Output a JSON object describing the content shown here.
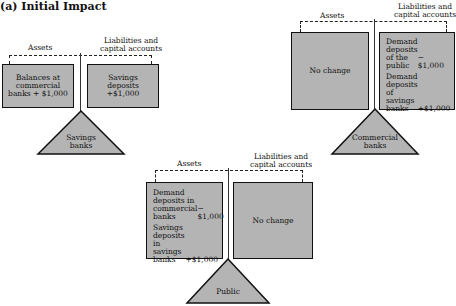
{
  "title": "(a) Initial Impact",
  "colors": {
    "box_fill": "#b4b4b4",
    "stroke": "#111111"
  },
  "savings_banks": {
    "assets_label": "Assets",
    "liabilities_label_1": "Liabilities and",
    "liabilities_label_2": "capital accounts",
    "assets_box": [
      "Balances at",
      "commercial",
      "banks + $1,000"
    ],
    "liabilities_box": [
      "Savings",
      "deposits",
      "+$1,000"
    ],
    "fulcrum_1": "Savings",
    "fulcrum_2": "banks"
  },
  "commercial_banks": {
    "assets_label": "Assets",
    "liabilities_label_1": "Liabilities and",
    "liabilities_label_2": "capital accounts",
    "assets_box": "No change",
    "liabilities_entries": [
      {
        "lines": [
          "Demand",
          "deposits",
          "of the",
          "public"
        ],
        "value": "−$1,000"
      },
      {
        "lines": [
          "Demand",
          "deposits of",
          "savings",
          "banks"
        ],
        "value": "+$1,000"
      }
    ],
    "fulcrum_1": "Commercial",
    "fulcrum_2": "banks"
  },
  "public": {
    "assets_label": "Assets",
    "liabilities_label_1": "Liabilities and",
    "liabilities_label_2": "capital accounts",
    "assets_entries": [
      {
        "lines": [
          "Demand",
          "deposits in",
          "commercial",
          "banks"
        ],
        "value": "−$1,000"
      },
      {
        "lines": [
          "Savings",
          "deposits in",
          "savings",
          "banks"
        ],
        "value": "+$1,000"
      }
    ],
    "liabilities_box": "No change",
    "fulcrum_1": "Public",
    "fulcrum_2": ""
  }
}
